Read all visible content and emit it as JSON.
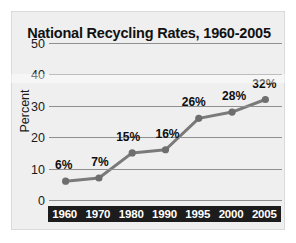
{
  "chart_data": {
    "type": "line",
    "title": "National Recycling Rates, 1960-2005",
    "xlabel": "",
    "ylabel": "Percent",
    "categories": [
      "1960",
      "1970",
      "1980",
      "1990",
      "1995",
      "2000",
      "2005"
    ],
    "values": [
      6,
      7,
      15,
      16,
      26,
      28,
      32
    ],
    "point_labels": [
      "6%",
      "7%",
      "15%",
      "16%",
      "26%",
      "28%",
      "32%"
    ],
    "ylim": [
      0,
      50
    ],
    "yticks": [
      50,
      40,
      30,
      20,
      10,
      0
    ],
    "ytick_labels": [
      "50",
      "40",
      "30",
      "20",
      "10",
      "0"
    ],
    "grid": true,
    "legend": "none",
    "series_color": "#7a7a7a",
    "marker_color": "#6e6e6e",
    "axis_band_color": "#1c1c1c",
    "panel_color": "#efefef",
    "gridline_color": "#8f8f8f",
    "text_color": "#111111"
  }
}
